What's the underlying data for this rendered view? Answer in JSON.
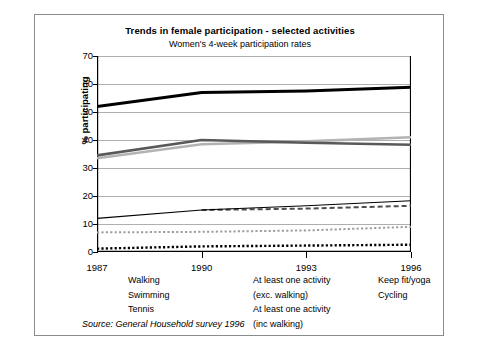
{
  "chart_data": {
    "type": "line",
    "title": "Trends in female participation - selected activities",
    "subtitle": "Women's 4-week participation rates",
    "xlabel": "",
    "ylabel": "% participating",
    "x": [
      1987,
      1990,
      1993,
      1996
    ],
    "xticklabels": [
      "1987",
      "1990",
      "1993",
      "1996"
    ],
    "yticklabels": [
      "0",
      "10",
      "20",
      "30",
      "40",
      "50",
      "60",
      "70"
    ],
    "ylim": [
      0,
      70
    ],
    "xlim": [
      1987,
      1996
    ],
    "ytick_step": 10,
    "grid": "horizontal",
    "legend_position": "below-axes",
    "source": "Source: General Household survey 1996",
    "series": [
      {
        "name": "Walking",
        "style": "solid",
        "color": "#b3b3b3",
        "width": 2.6,
        "x": [
          1987,
          1990,
          1993,
          1996
        ],
        "values": [
          33.5,
          38.5,
          39.5,
          41.0
        ]
      },
      {
        "name": "Swimming",
        "style": "dashed",
        "color": "#4d4d4d",
        "width": 2.0,
        "x": [
          1990,
          1993,
          1996
        ],
        "values": [
          15.0,
          15.5,
          16.5
        ]
      },
      {
        "name": "Tennis",
        "style": "dotted",
        "color": "#000000",
        "width": 2.4,
        "x": [
          1987,
          1990,
          1993,
          1996
        ],
        "values": [
          1.2,
          2.0,
          2.3,
          2.6
        ]
      },
      {
        "name": "At least one activity (exc. walking)",
        "style": "solid",
        "color": "#595959",
        "width": 2.6,
        "x": [
          1987,
          1990,
          1993,
          1996
        ],
        "values": [
          34.5,
          40.0,
          39.0,
          38.3
        ]
      },
      {
        "name": "At least one activity (inc walking)",
        "style": "solid",
        "color": "#000000",
        "width": 3.0,
        "x": [
          1987,
          1990,
          1993,
          1996
        ],
        "values": [
          52.0,
          57.0,
          57.5,
          58.8
        ]
      },
      {
        "name": "Keep fit/yoga",
        "style": "solid",
        "color": "#000000",
        "width": 1.1,
        "x": [
          1987,
          1990,
          1993,
          1996
        ],
        "values": [
          12.0,
          15.0,
          16.5,
          18.3
        ]
      },
      {
        "name": "Cycling",
        "style": "dotted",
        "color": "#9e9e9e",
        "width": 2.0,
        "x": [
          1987,
          1990,
          1993,
          1996
        ],
        "values": [
          7.0,
          7.2,
          7.7,
          9.0
        ]
      }
    ],
    "legend": [
      {
        "label": "Walking",
        "label2": "",
        "swatch": "walking"
      },
      {
        "label": "Swimming",
        "label2": "",
        "swatch": "swimming"
      },
      {
        "label": "Tennis",
        "label2": "",
        "swatch": "tennis"
      },
      {
        "label": "At least one activity",
        "label2": "(exc. walking)",
        "swatch": "exc-walking"
      },
      {
        "label": "At least one activity",
        "label2": "(inc walking)",
        "swatch": "inc-walking"
      },
      {
        "label": "Keep fit/yoga",
        "label2": "",
        "swatch": "keepfit"
      },
      {
        "label": "Cycling",
        "label2": "",
        "swatch": "cycling"
      }
    ]
  }
}
